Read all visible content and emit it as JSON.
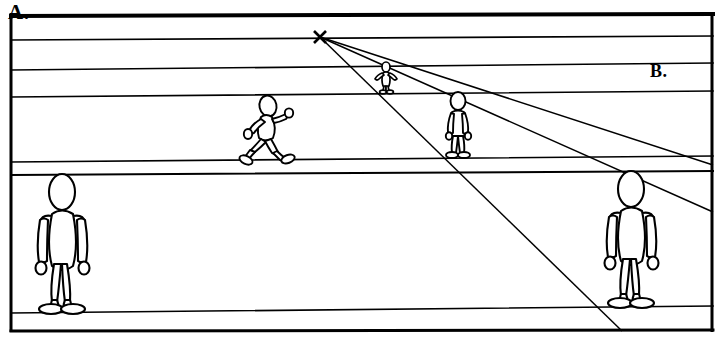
{
  "figure": {
    "type": "line-diagram",
    "background_color": "#ffffff",
    "stroke_color": "#000000"
  },
  "labels": {
    "a": "A.",
    "b": "B."
  },
  "frame": {
    "name": "outer-border",
    "x": 10,
    "y": 14,
    "width": 703,
    "height": 317
  },
  "horizon_lines": [
    {
      "name": "line-1-top-thick",
      "y_left": 16,
      "y_right": 14,
      "thickness": 4
    },
    {
      "name": "line-2-vanishing-level",
      "y_left": 40,
      "y_right": 36,
      "thickness": 1.6
    },
    {
      "name": "line-3",
      "y_left": 70,
      "y_right": 63,
      "thickness": 1.6
    },
    {
      "name": "line-4",
      "y_left": 97,
      "y_right": 91,
      "thickness": 1.6
    },
    {
      "name": "line-5",
      "y_left": 162,
      "y_right": 156,
      "thickness": 1.6
    },
    {
      "name": "line-6",
      "y_left": 175,
      "y_right": 171,
      "thickness": 2
    },
    {
      "name": "line-7-ground",
      "y_left": 313,
      "y_right": 306,
      "thickness": 1.6
    },
    {
      "name": "line-8-bottom-thick",
      "y_left": 331,
      "y_right": 330,
      "thickness": 3
    }
  ],
  "vanishing_point": {
    "name": "vanishing-point-x-mark",
    "x": 320,
    "y": 37,
    "marker": "x-cross"
  },
  "convergence_rays": [
    {
      "name": "ray-shallow",
      "x1": 320,
      "y1": 37,
      "x2": 713,
      "y2": 212
    },
    {
      "name": "ray-mid",
      "x1": 320,
      "y1": 37,
      "x2": 713,
      "y2": 165
    },
    {
      "name": "ray-steep",
      "x1": 320,
      "y1": 37,
      "x2": 622,
      "y2": 331
    }
  ],
  "figures": [
    {
      "name": "stick-figure-left-large",
      "pose": "standing",
      "scale": "large",
      "head_x": 63,
      "head_top_y": 175,
      "feet_y": 312,
      "height_px": 137
    },
    {
      "name": "stick-figure-right-large",
      "pose": "standing",
      "scale": "large",
      "head_x": 631,
      "head_top_y": 172,
      "feet_y": 306,
      "height_px": 134
    },
    {
      "name": "stick-figure-mid-walking",
      "pose": "walking",
      "scale": "medium",
      "head_x": 267,
      "head_top_y": 98,
      "feet_y": 160,
      "height_px": 62
    },
    {
      "name": "stick-figure-mid-standing",
      "pose": "standing",
      "scale": "medium",
      "head_x": 458,
      "head_top_y": 93,
      "feet_y": 157,
      "height_px": 64
    },
    {
      "name": "stick-figure-small-standing",
      "pose": "standing",
      "scale": "small",
      "head_x": 386,
      "head_top_y": 63,
      "feet_y": 92,
      "height_px": 29
    }
  ]
}
